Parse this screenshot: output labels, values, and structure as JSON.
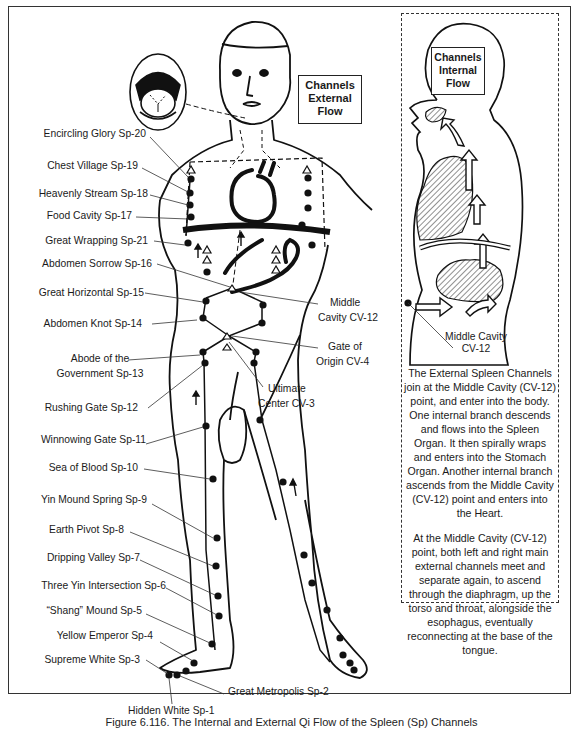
{
  "figure": {
    "caption": "Figure 6.116. The Internal and External Qi Flow of the Spleen (Sp) Channels"
  },
  "boxes": {
    "external": [
      "Channels",
      "External",
      "Flow"
    ],
    "internal": [
      "Channels",
      "Internal",
      "Flow"
    ]
  },
  "points_left": [
    {
      "label": "Encircling Glory Sp-20"
    },
    {
      "label": "Chest Village Sp-19"
    },
    {
      "label": "Heavenly Stream Sp-18"
    },
    {
      "label": "Food Cavity Sp-17"
    },
    {
      "label": "Great Wrapping Sp-21"
    },
    {
      "label": "Abdomen Sorrow Sp-16"
    },
    {
      "label": "Great Horizontal Sp-15"
    },
    {
      "label": "Abdomen Knot Sp-14"
    },
    {
      "label": "Abode of the",
      "label2": "Government Sp-13"
    },
    {
      "label": "Rushing Gate Sp-12"
    },
    {
      "label": "Winnowing Gate Sp-11"
    },
    {
      "label": "Sea of Blood Sp-10"
    },
    {
      "label": "Yin Mound Spring Sp-9"
    },
    {
      "label": "Earth Pivot Sp-8"
    },
    {
      "label": "Dripping Valley Sp-7"
    },
    {
      "label": "Three Yin Intersection Sp-6"
    },
    {
      "label": "“Shang” Mound Sp-5"
    },
    {
      "label": "Yellow Emperor Sp-4"
    },
    {
      "label": "Supreme White Sp-3"
    }
  ],
  "points_bottom": {
    "great_metropolis": "Great Metropolis Sp-2",
    "hidden_white": "Hidden White Sp-1"
  },
  "points_center": {
    "middle_cavity": [
      "Middle",
      "Cavity CV-12"
    ],
    "gate_of_origin": [
      "Gate of",
      "Origin CV-4"
    ],
    "ultimate_center": [
      "Ultimate",
      "Center CV-3"
    ]
  },
  "internal_panel": {
    "middle_cavity": [
      "Middle Cavity",
      "CV-12"
    ],
    "description": [
      "The External Spleen Channels join at the Middle Cavity (CV-12) point, and enter into the body. One internal branch descends and flows into the Spleen Organ. It then spirally wraps and enters into the Stomach Organ. Another internal branch ascends from the Middle Cavity (CV-12) point and enters into the Heart.",
      "At the Middle Cavity (CV-12) point, both left and right main external channels meet and separate again, to ascend through the diaphragm, up the torso and throat, alongside the esophagus, eventually reconnecting at the base of the tongue."
    ]
  },
  "colors": {
    "line": "#111111",
    "border": "#333333",
    "background": "#ffffff"
  }
}
